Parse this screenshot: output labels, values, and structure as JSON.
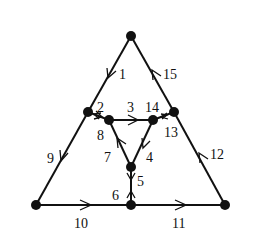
{
  "diagram": {
    "type": "directed-graph",
    "nodes": [
      {
        "id": "top",
        "x": 131,
        "y": 36
      },
      {
        "id": "left-mid",
        "x": 88,
        "y": 112
      },
      {
        "id": "right-mid",
        "x": 174,
        "y": 112
      },
      {
        "id": "inner-left",
        "x": 109,
        "y": 120
      },
      {
        "id": "inner-right",
        "x": 153,
        "y": 120
      },
      {
        "id": "inner-bottom",
        "x": 131,
        "y": 167
      },
      {
        "id": "bottom-left",
        "x": 36,
        "y": 205
      },
      {
        "id": "bottom-center",
        "x": 131,
        "y": 205
      },
      {
        "id": "bottom-right",
        "x": 225,
        "y": 205
      }
    ],
    "edges": [
      {
        "label": "1",
        "from": "top",
        "to": "left-mid"
      },
      {
        "label": "2",
        "from": "left-mid",
        "to": "inner-left"
      },
      {
        "label": "3",
        "from": "inner-left",
        "to": "inner-right"
      },
      {
        "label": "4",
        "from": "inner-right",
        "to": "inner-bottom"
      },
      {
        "label": "5",
        "from": "inner-bottom",
        "to": "bottom-center"
      },
      {
        "label": "6",
        "from": "bottom-center",
        "to": "inner-bottom"
      },
      {
        "label": "7",
        "from": "inner-bottom",
        "to": "inner-left"
      },
      {
        "label": "8",
        "from": "inner-left",
        "to": "left-mid"
      },
      {
        "label": "9",
        "from": "left-mid",
        "to": "bottom-left"
      },
      {
        "label": "10",
        "from": "bottom-left",
        "to": "bottom-center"
      },
      {
        "label": "11",
        "from": "bottom-center",
        "to": "bottom-right"
      },
      {
        "label": "12",
        "from": "bottom-right",
        "to": "right-mid"
      },
      {
        "label": "13",
        "from": "right-mid",
        "to": "inner-right"
      },
      {
        "label": "14",
        "from": "inner-right",
        "to": "right-mid"
      },
      {
        "label": "15",
        "from": "right-mid",
        "to": "top"
      }
    ]
  },
  "labels": {
    "e1": "1",
    "e2": "2",
    "e3": "3",
    "e4": "4",
    "e5": "5",
    "e6": "6",
    "e7": "7",
    "e8": "8",
    "e9": "9",
    "e10": "10",
    "e11": "11",
    "e12": "12",
    "e13": "13",
    "e14": "14",
    "e15": "15"
  }
}
